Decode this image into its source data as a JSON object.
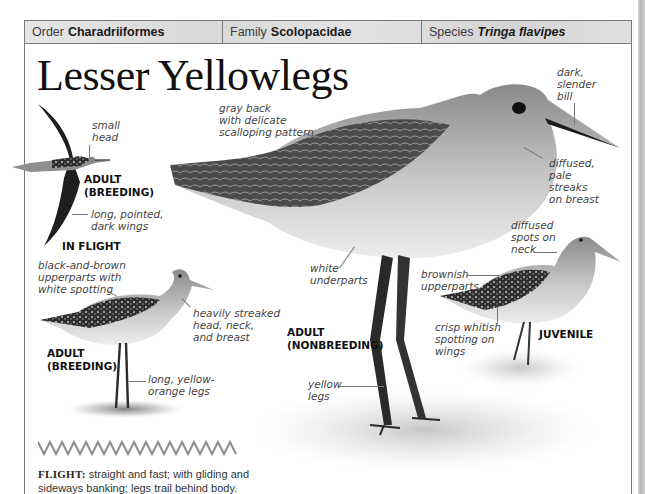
{
  "taxonomy": {
    "order": {
      "label": "Order",
      "value": "Charadriiformes"
    },
    "family": {
      "label": "Family",
      "value": "Scolopacidae"
    },
    "species": {
      "label": "Species",
      "value": "Tringa flavipes"
    }
  },
  "title": "Lesser Yellowlegs",
  "in_flight": {
    "stage_label": "ADULT\n(BREEDING)",
    "caption": "IN FLIGHT",
    "notes": {
      "head": "small\nhead",
      "wings": "long, pointed,\ndark wings"
    }
  },
  "adult_breeding": {
    "stage_label": "ADULT\n(BREEDING)",
    "notes": {
      "upperparts": "black-and-brown\nupperparts with\nwhite spotting",
      "streaks": "heavily streaked\nhead, neck,\nand breast",
      "legs": "long, yellow-\norange legs"
    }
  },
  "adult_nonbreeding": {
    "stage_label": "ADULT\n(NONBREEDING)",
    "notes": {
      "back": "gray back\nwith delicate\nscalloping pattern",
      "bill": "dark,\nslender\nbill",
      "breast": "diffused,\npale\nstreaks\non breast",
      "underparts": "white\nunderparts",
      "legs": "yellow\nlegs"
    }
  },
  "juvenile": {
    "stage_label": "JUVENILE",
    "notes": {
      "neck": "diffused\nspots on\nneck",
      "upperparts": "brownish\nupperparts",
      "wings": "crisp whitish\nspotting on\nwings"
    }
  },
  "flight_pattern": {
    "label": "FLIGHT:",
    "text": " straight and fast; with gliding and sideways banking; legs trail behind body."
  },
  "colors": {
    "frame": "#7a7a7a",
    "bar_bg": "#dddddd",
    "text": "#1a1a1a",
    "note_text": "#444444",
    "zigzag": "#8a8a8a"
  }
}
